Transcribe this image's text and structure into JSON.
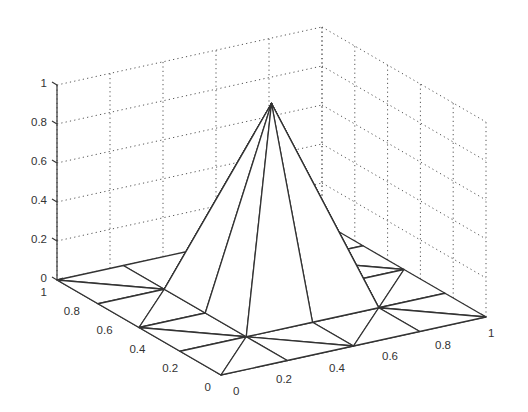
{
  "chart_data": {
    "type": "surface-mesh-3d",
    "title": "",
    "xlabel": "",
    "ylabel": "",
    "zlabel": "",
    "grid": true,
    "xlim": [
      0,
      1
    ],
    "ylim": [
      0,
      1
    ],
    "zlim": [
      0,
      1
    ],
    "x_ticks": [
      "0",
      "0.2",
      "0.4",
      "0.6",
      "0.8",
      "1"
    ],
    "y_ticks": [
      "0",
      "0.2",
      "0.4",
      "0.6",
      "0.8",
      "1"
    ],
    "z_ticks": [
      "0",
      "0.2",
      "0.4",
      "0.6",
      "0.8",
      "1"
    ],
    "mesh": {
      "description": "Piecewise-linear hat (pyramid) basis function on a triangulated 5x5 grid of the unit square",
      "node_spacing": 0.25,
      "x": [
        0,
        0.25,
        0.5,
        0.75,
        1
      ],
      "y": [
        0,
        0.25,
        0.5,
        0.75,
        1
      ],
      "z": [
        [
          0,
          0,
          0,
          0,
          0
        ],
        [
          0,
          0,
          0,
          0,
          0
        ],
        [
          0,
          0,
          1,
          0,
          0
        ],
        [
          0,
          0,
          0,
          0,
          0
        ],
        [
          0,
          0,
          0,
          0,
          0
        ]
      ],
      "peak": {
        "x": 0.5,
        "y": 0.5,
        "z": 1
      }
    }
  }
}
